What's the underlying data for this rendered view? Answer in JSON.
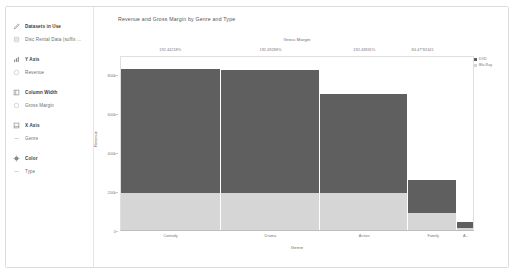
{
  "sidebar": {
    "groups": [
      {
        "header": {
          "label": "Datasets in Use",
          "icon": "pencil-icon"
        },
        "fields": [
          {
            "label": "Disc Rental Data (suffix ...",
            "icon": "database-icon"
          }
        ]
      },
      {
        "header": {
          "label": "Y Axis",
          "icon": "bar-chart-icon"
        },
        "fields": [
          {
            "label": "Revenue",
            "icon": "measure-icon"
          }
        ]
      },
      {
        "header": {
          "label": "Column Width",
          "icon": "column-width-icon"
        },
        "fields": [
          {
            "label": "Gross Margin",
            "icon": "measure-icon"
          }
        ]
      },
      {
        "header": {
          "label": "X Axis",
          "icon": "x-axis-icon"
        },
        "fields": [
          {
            "label": "Genre",
            "icon": "dimension-icon"
          }
        ]
      },
      {
        "header": {
          "label": "Color",
          "icon": "palette-icon"
        },
        "fields": [
          {
            "label": "Type",
            "icon": "dimension-icon"
          }
        ]
      }
    ]
  },
  "main": {
    "chart_title": "Revenue and Gross Margin by Genre and Type"
  },
  "legend": {
    "items": [
      {
        "label": "DVD",
        "color": "#5f5f5f"
      },
      {
        "label": "Blu-Ray",
        "color": "#d6d6d6"
      }
    ]
  },
  "colors": {
    "series_top": "#5f5f5f",
    "series_bottom": "#d6d6d6",
    "frame": "#e0e0e0",
    "text": "#7a7a7a"
  },
  "chart_data": {
    "type": "bar",
    "subtype": "marimekko-stacked-variable-width",
    "title": "Revenue and Gross Margin by Genre and Type",
    "xlabel": "Genre",
    "ylabel": "Revenue",
    "top_axis_label": "Gross Margin",
    "categories": [
      "Comedy",
      "Drama",
      "Action",
      "Family",
      "A..."
    ],
    "column_widths_pct": [
      28.5,
      28.0,
      25.0,
      14.0,
      4.5
    ],
    "top_tick_labels": [
      "192.44218%",
      "192.49288%",
      "192.43831%",
      "84.47*82441"
    ],
    "top_tick_positions_pct": [
      14.2,
      42.5,
      69.0,
      85.5
    ],
    "ylim": [
      0,
      900000
    ],
    "ytick_labels": [
      "800k",
      "600k",
      "400k",
      "200k",
      "0"
    ],
    "ytick_values": [
      800000,
      600000,
      400000,
      200000,
      0
    ],
    "grid": false,
    "legend_position": "right",
    "series": [
      {
        "name": "DVD",
        "color": "#5f5f5f",
        "values": [
          650000,
          640000,
          520000,
          170000,
          30000
        ]
      },
      {
        "name": "Blu-Ray",
        "color": "#d6d6d6",
        "values": [
          190000,
          190000,
          190000,
          90000,
          10000
        ]
      }
    ]
  }
}
